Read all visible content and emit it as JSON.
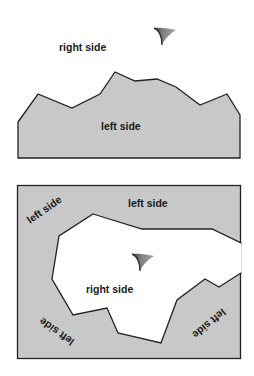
{
  "colors": {
    "region_fill": "#c8c8c8",
    "outline": "#222222",
    "background": "#ffffff",
    "arrow_fill": "#8a8a8a",
    "arrow_dark": "#333333"
  },
  "diagram_top": {
    "label_right": "right side",
    "label_left": "left side",
    "arrow_icon": "arrowhead-pointing-right"
  },
  "diagram_bottom": {
    "label_left_top": "left side",
    "label_left_upper_left": "left side",
    "label_left_bottom_left": "left side",
    "label_left_bottom_right": "left side",
    "label_right": "right side",
    "arrow_icon": "arrowhead-pointing-right"
  }
}
